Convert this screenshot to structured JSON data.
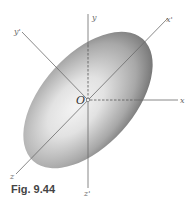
{
  "figure": {
    "caption": "Fig. 9.44",
    "origin_label": "O",
    "axes": {
      "x": "x",
      "y": "y",
      "z": "z",
      "x_prime": "x'",
      "y_prime": "y'",
      "z_prime": "z'"
    },
    "colors": {
      "axis_line": "#6b6b6b",
      "ellipsoid_dark": "#6e6e6e",
      "ellipsoid_light": "#f2f2f2"
    }
  }
}
